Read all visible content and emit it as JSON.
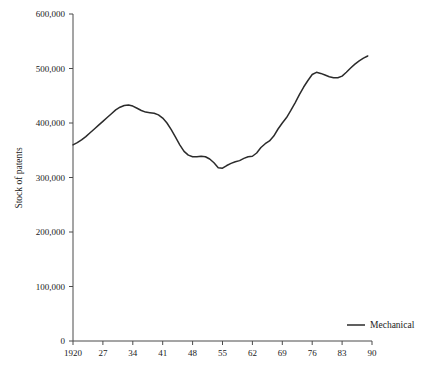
{
  "chart_data": {
    "type": "line",
    "title": "",
    "xlabel": "",
    "ylabel": "Stock of patents",
    "xlim": [
      1920,
      1990
    ],
    "ylim": [
      0,
      600000
    ],
    "grid": false,
    "legend_position": "right",
    "x_tick_labels": [
      "1920",
      "27",
      "34",
      "41",
      "48",
      "55",
      "62",
      "69",
      "76",
      "83",
      "90"
    ],
    "x_tick_values": [
      1920,
      1927,
      1934,
      1941,
      1948,
      1955,
      1962,
      1969,
      1976,
      1983,
      1990
    ],
    "y_tick_labels": [
      "0",
      "100,000",
      "200,000",
      "300,000",
      "400,000",
      "500,000",
      "600,000"
    ],
    "y_tick_values": [
      0,
      100000,
      200000,
      300000,
      400000,
      500000,
      600000
    ],
    "series": [
      {
        "name": "Mechanical",
        "color": "#2b2b2b",
        "x": [
          1920,
          1921,
          1922,
          1923,
          1924,
          1925,
          1926,
          1927,
          1928,
          1929,
          1930,
          1931,
          1932,
          1933,
          1934,
          1935,
          1936,
          1937,
          1938,
          1939,
          1940,
          1941,
          1942,
          1943,
          1944,
          1945,
          1946,
          1947,
          1948,
          1949,
          1950,
          1951,
          1952,
          1953,
          1954,
          1955,
          1956,
          1957,
          1958,
          1959,
          1960,
          1961,
          1962,
          1963,
          1964,
          1965,
          1966,
          1967,
          1968,
          1969,
          1970,
          1971,
          1972,
          1973,
          1974,
          1975,
          1976,
          1977,
          1978,
          1979,
          1980,
          1981,
          1982,
          1983,
          1984,
          1985,
          1986,
          1987,
          1988,
          1989
        ],
        "values": [
          360000,
          364000,
          369000,
          375000,
          382000,
          389000,
          396000,
          403000,
          410000,
          417000,
          424000,
          429000,
          432000,
          433000,
          431000,
          427000,
          423000,
          420000,
          419000,
          418000,
          415000,
          409000,
          400000,
          388000,
          374000,
          360000,
          348000,
          341000,
          338000,
          338000,
          339000,
          338000,
          334000,
          327000,
          318000,
          317000,
          322000,
          326000,
          329000,
          331000,
          335000,
          338000,
          339000,
          345000,
          355000,
          362000,
          367000,
          376000,
          389000,
          400000,
          410000,
          423000,
          437000,
          452000,
          466000,
          478000,
          489000,
          493000,
          491000,
          488000,
          485000,
          483000,
          483000,
          486000,
          493000,
          501000,
          508000,
          514000,
          519000,
          523000
        ]
      }
    ]
  },
  "legend": {
    "entries": [
      {
        "label": "Mechanical"
      }
    ]
  }
}
